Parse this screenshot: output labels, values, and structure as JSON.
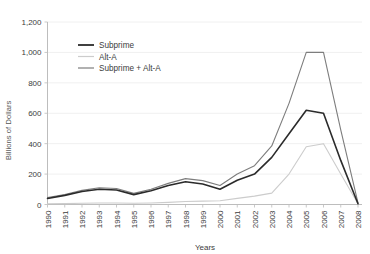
{
  "chart_data": {
    "type": "line",
    "title": "",
    "xlabel": "Years",
    "ylabel": "Billions of Dollars",
    "ylim": [
      0,
      1200
    ],
    "yticks": [
      "0",
      "200",
      "400",
      "600",
      "800",
      "1,000",
      "1,200"
    ],
    "ytick_values": [
      0,
      200,
      400,
      600,
      800,
      1000,
      1200
    ],
    "grid": true,
    "legend_position": "top-left-inside",
    "categories": [
      "1990",
      "1991",
      "1992",
      "1993",
      "1994",
      "1995",
      "1996",
      "1997",
      "1998",
      "1999",
      "2000",
      "2001",
      "2002",
      "2003",
      "2004",
      "2005",
      "2006",
      "2007",
      "2008"
    ],
    "series": [
      {
        "name": "Subprime",
        "color": "#2b2b2b",
        "values": [
          40,
          60,
          85,
          100,
          95,
          65,
          90,
          125,
          150,
          135,
          100,
          160,
          200,
          310,
          465,
          620,
          600,
          290,
          5
        ]
      },
      {
        "name": "Alt-A",
        "color": "#cccccc",
        "values": [
          5,
          6,
          8,
          10,
          10,
          8,
          10,
          14,
          20,
          22,
          25,
          40,
          55,
          75,
          200,
          380,
          400,
          200,
          5
        ]
      },
      {
        "name": "Subprime + Alt-A",
        "color": "#7d7d7d",
        "values": [
          45,
          66,
          93,
          110,
          105,
          73,
          100,
          139,
          170,
          157,
          125,
          200,
          255,
          385,
          665,
          1000,
          1000,
          490,
          10
        ]
      }
    ]
  },
  "legend": {
    "items": [
      {
        "label": "Subprime"
      },
      {
        "label": "Alt-A"
      },
      {
        "label": "Subprime + Alt-A"
      }
    ]
  },
  "axes": {
    "y_title": "Billions of Dollars",
    "x_title": "Years"
  }
}
